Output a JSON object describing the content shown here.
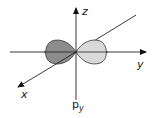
{
  "diagram": {
    "title_main": "p",
    "title_sub": "y",
    "axes": {
      "x_label": "x",
      "y_label": "y",
      "z_label": "z"
    },
    "lobes": {
      "negative_color": "#8c8c8c",
      "positive_color": "#d9d9d9",
      "stroke_color": "#333333"
    }
  }
}
